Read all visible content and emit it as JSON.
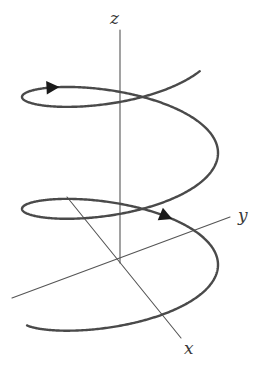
{
  "figure": {
    "kind": "math-diagram",
    "background_color": "#ffffff",
    "axis_color": "#555555",
    "curve_color": "#4a4a4a",
    "label_color": "#3a3a3a",
    "arrow_color": "#1a1a1a",
    "canvas": {
      "width": 269,
      "height": 371
    }
  },
  "labels": {
    "z": "z",
    "y": "y",
    "x": "x"
  },
  "axes": [
    {
      "name": "z-axis",
      "label": "z",
      "from": {
        "x": 120,
        "y": 30
      },
      "to": {
        "x": 120,
        "y": 263
      },
      "stroke_width": 1.1
    },
    {
      "name": "y-axis",
      "label": "y",
      "from": {
        "x": 12,
        "y": 298
      },
      "to": {
        "x": 230,
        "y": 217
      },
      "stroke_width": 1.1
    },
    {
      "name": "x-axis",
      "label": "x",
      "from": {
        "x": 67,
        "y": 197
      },
      "to": {
        "x": 181,
        "y": 338
      },
      "stroke_width": 1.1
    }
  ],
  "origin": {
    "x": 120,
    "y": 263
  },
  "helix": {
    "name": "helix-curve",
    "turns": 2.35,
    "axis": "z",
    "center_x": 120,
    "radius_x": 98,
    "radius_y": 33,
    "top_y": 52,
    "bottom_y": 315,
    "stroke_width": 2.4,
    "direction": "counterclockwise-ascending"
  },
  "arrows": [
    {
      "name": "upper-arrowhead",
      "position": {
        "x": 218,
        "y": 108
      },
      "angle_deg": 118,
      "size": 13
    },
    {
      "name": "lower-arrowhead",
      "position": {
        "x": 206,
        "y": 263
      },
      "angle_deg": -84,
      "size": 13
    }
  ],
  "chart_data": {
    "type": "line",
    "xlabel": "x",
    "ylabel": "y",
    "zlabel": "z",
    "legend": [],
    "grid": false,
    "annotations": [
      "x",
      "y",
      "z"
    ],
    "series": [
      {
        "name": "helix",
        "parametric": true,
        "equations": {
          "x": "r*cos(t)",
          "y": "r*sin(t)",
          "z": "c*t"
        },
        "t_range": [
          0,
          14.8
        ],
        "radius": 1,
        "turns": 2.35
      }
    ]
  }
}
